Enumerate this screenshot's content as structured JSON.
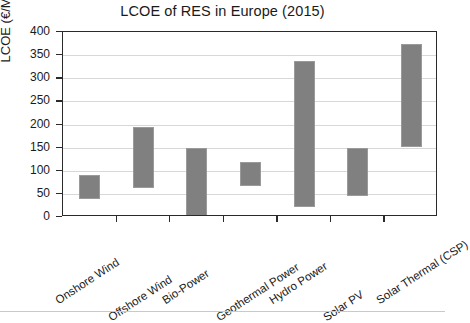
{
  "chart_data": {
    "type": "bar",
    "bar_style": "floating-range",
    "title": "LCOE of RES in Europe (2015)",
    "xlabel": "",
    "ylabel": "LCOE (€/MWh)",
    "ylim": [
      0,
      400
    ],
    "ytick_step": 50,
    "ytick_labels": [
      "0",
      "50",
      "100",
      "150",
      "200",
      "250",
      "300",
      "350",
      "400"
    ],
    "ytick_values": [
      0,
      50,
      100,
      150,
      200,
      250,
      300,
      350,
      400
    ],
    "grid": true,
    "grid_axis": "y",
    "legend": "none",
    "categories": [
      "Onshore Wind",
      "Offshore Wind",
      "Bio-Power",
      "Geothermal Power",
      "Hydro Power",
      "Solar PV",
      "Solar Thermal (CSP)"
    ],
    "series": [
      {
        "name": "LCOE low",
        "values": [
          40,
          63,
          3,
          68,
          22,
          45,
          152
        ]
      },
      {
        "name": "LCOE high",
        "values": [
          90,
          195,
          150,
          120,
          338,
          150,
          375
        ]
      }
    ],
    "bars": [
      {
        "category": "Onshore Wind",
        "low": 40,
        "high": 90
      },
      {
        "category": "Offshore Wind",
        "low": 63,
        "high": 195
      },
      {
        "category": "Bio-Power",
        "low": 3,
        "high": 150
      },
      {
        "category": "Geothermal Power",
        "low": 68,
        "high": 120
      },
      {
        "category": "Hydro Power",
        "low": 22,
        "high": 338
      },
      {
        "category": "Solar PV",
        "low": 45,
        "high": 150
      },
      {
        "category": "Solar Thermal (CSP)",
        "low": 152,
        "high": 375
      }
    ],
    "colors": {
      "bar": "#808080",
      "bar_edge": "#9a9a9a",
      "grid": "#d8d8d8",
      "axis": "#2a2a2a",
      "text": "#1a1a1a",
      "background": "#ffffff"
    }
  }
}
